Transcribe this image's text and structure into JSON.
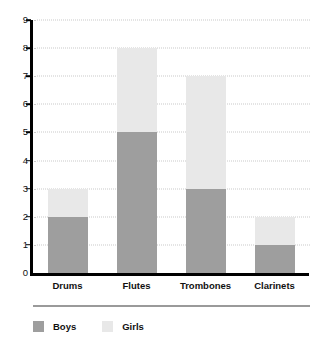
{
  "chart_data": {
    "type": "bar",
    "subtype": "stacked-bar",
    "title": "",
    "xlabel": "",
    "ylabel": "",
    "categories": [
      "Drums",
      "Flutes",
      "Trombones",
      "Clarinets"
    ],
    "series": [
      {
        "name": "Boys",
        "values": [
          2,
          5,
          3,
          1
        ],
        "color": "#9e9e9e"
      },
      {
        "name": "Girls",
        "values": [
          1,
          3,
          4,
          1
        ],
        "color": "#e8e8e8"
      }
    ],
    "totals": [
      3,
      8,
      7,
      2
    ],
    "ylim": [
      0,
      9
    ],
    "ytick_labels": [
      "0",
      "1",
      "2",
      "3",
      "4",
      "5",
      "6",
      "7",
      "8",
      "9"
    ],
    "ytick_values": [
      0,
      1,
      2,
      3,
      4,
      5,
      6,
      7,
      8,
      9
    ],
    "grid": true,
    "grid_style": "dotted",
    "grid_axis": "y",
    "legend_position": "bottom-left",
    "axis_color": "#000000",
    "grid_color": "#c9c9c9",
    "background": "#ffffff"
  },
  "legend": {
    "entries": [
      {
        "label": "Boys",
        "color": "#9e9e9e"
      },
      {
        "label": "Girls",
        "color": "#e8e8e8"
      }
    ]
  }
}
